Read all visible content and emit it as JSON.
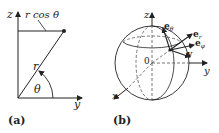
{
  "panel_a": {
    "caption": "(a)",
    "labels": {
      "z_axis": "z",
      "y_axis": "y",
      "projection": "r cos θ",
      "radius": "r",
      "angle": "θ"
    }
  },
  "panel_b": {
    "caption": "(b)",
    "labels": {
      "z_axis": "z",
      "y_axis": "y",
      "x_axis": "x",
      "origin": "0",
      "e_theta": "e",
      "e_theta_sub": "θ",
      "e_r": "e",
      "e_r_sub": "r",
      "e_phi": "e",
      "e_phi_sub": "φ",
      "v": "v"
    }
  },
  "colors": {
    "line": "#222222",
    "dashed": "#555555"
  }
}
